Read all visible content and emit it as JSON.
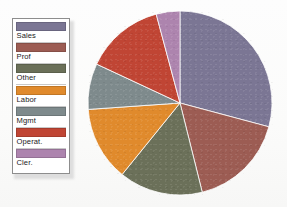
{
  "legend": {
    "name": "chart-legend",
    "items": [
      {
        "label": "Sales",
        "color": "#7b7694"
      },
      {
        "label": "Prof",
        "color": "#9c5c53"
      },
      {
        "label": "Other",
        "color": "#6b7059"
      },
      {
        "label": "Labor",
        "color": "#e08a2c"
      },
      {
        "label": "Mgmt",
        "color": "#7e8a8c"
      },
      {
        "label": "Operat.",
        "color": "#c04534"
      },
      {
        "label": "Cler.",
        "color": "#ad84ae"
      }
    ]
  },
  "chart_data": {
    "type": "pie",
    "title": "",
    "legend_position": "left",
    "start_angle": 0,
    "direction": "clockwise",
    "categories": [
      "Sales",
      "Prof",
      "Other",
      "Labor",
      "Mgmt",
      "Operat.",
      "Cler."
    ],
    "values": [
      29,
      17,
      15,
      13,
      8,
      14,
      4
    ],
    "units": "percent",
    "colors": [
      "#7b7694",
      "#9c5c53",
      "#6b7059",
      "#e08a2c",
      "#7e8a8c",
      "#c04534",
      "#ad84ae"
    ],
    "slice_angles_deg": [
      {
        "name": "Sales",
        "start": 0,
        "end": 105
      },
      {
        "name": "Prof",
        "start": 105,
        "end": 166
      },
      {
        "name": "Other",
        "start": 166,
        "end": 219
      },
      {
        "name": "Labor",
        "start": 219,
        "end": 266
      },
      {
        "name": "Mgmt",
        "start": 266,
        "end": 295
      },
      {
        "name": "Operat.",
        "start": 295,
        "end": 345
      },
      {
        "name": "Cler.",
        "start": 345,
        "end": 360
      }
    ]
  }
}
